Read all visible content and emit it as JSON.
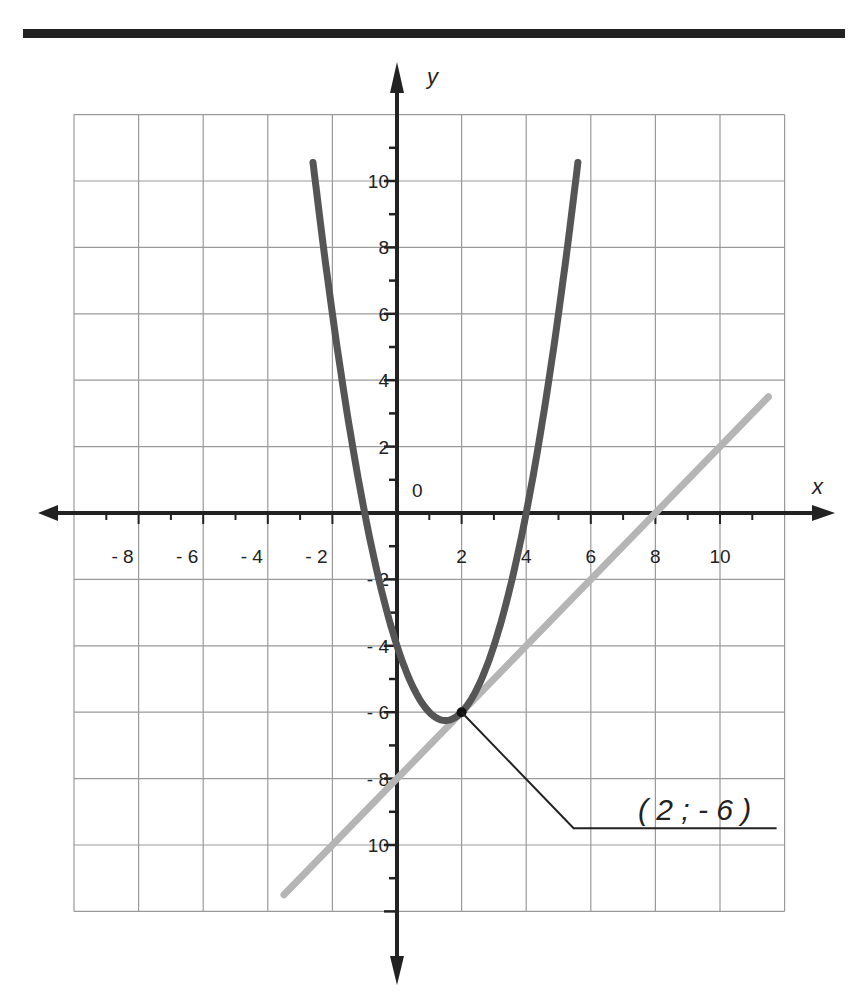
{
  "chart_data": {
    "type": "line",
    "title": "",
    "xlabel": "x",
    "ylabel": "y",
    "origin_label": "0",
    "xlim": [
      -10,
      12
    ],
    "ylim": [
      -12,
      12
    ],
    "grid": true,
    "x_tick_labels": [
      "- 8",
      "- 6",
      "- 4",
      "- 2",
      "2",
      "4",
      "6",
      "8",
      "10"
    ],
    "x_tick_values": [
      -8,
      -6,
      -4,
      -2,
      2,
      4,
      6,
      8,
      10
    ],
    "y_tick_labels": [
      "10",
      "8",
      "6",
      "4",
      "2",
      "- 2",
      "- 4",
      "- 6",
      "- 8",
      "10"
    ],
    "y_tick_values": [
      10,
      8,
      6,
      4,
      2,
      -2,
      -4,
      -6,
      -8,
      -10
    ],
    "series": [
      {
        "name": "parabola",
        "equation": "y = x^2 - 3x - 4",
        "color": "#555555",
        "x_range": [
          -2.6,
          5.6
        ],
        "points": [
          [
            -2.6,
            10.56
          ],
          [
            -2,
            6
          ],
          [
            -1,
            0
          ],
          [
            0,
            -4
          ],
          [
            1,
            -6
          ],
          [
            1.5,
            -6.25
          ],
          [
            2,
            -6
          ],
          [
            3,
            -4
          ],
          [
            4,
            0
          ],
          [
            5,
            6
          ],
          [
            5.6,
            10.56
          ]
        ]
      },
      {
        "name": "tangent line",
        "equation": "y = x - 8",
        "color": "#b0b0b0",
        "x_range": [
          -3.5,
          11.5
        ],
        "points": [
          [
            -3.5,
            -11.5
          ],
          [
            0,
            -8
          ],
          [
            2,
            -6
          ],
          [
            8,
            0
          ],
          [
            10,
            2
          ],
          [
            11.5,
            3.5
          ]
        ]
      }
    ],
    "annotations": [
      {
        "text": "( 2 ; - 6 )",
        "point": [
          2,
          -6
        ],
        "type": "leader-line label"
      }
    ]
  },
  "colors": {
    "axis": "#222222",
    "grid": "#9a9a9a",
    "parabola": "#555555",
    "line": "#b5b5b5",
    "rule": "#222222"
  }
}
